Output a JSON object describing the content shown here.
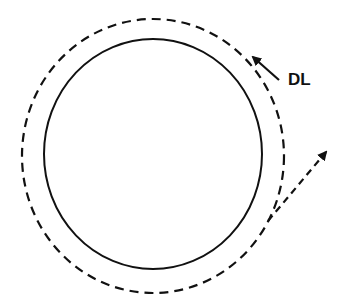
{
  "diagram": {
    "label_dl": "DL",
    "colors": {
      "stroke": "#111111",
      "background": "#ffffff"
    },
    "inner_circle": {
      "style": "solid"
    },
    "outer_circle": {
      "style": "dashed"
    },
    "arrow_dl": {
      "style": "solid",
      "points_to": "outer_circle"
    },
    "arrow_tangent": {
      "style": "dashed",
      "direction": "up-right"
    }
  }
}
